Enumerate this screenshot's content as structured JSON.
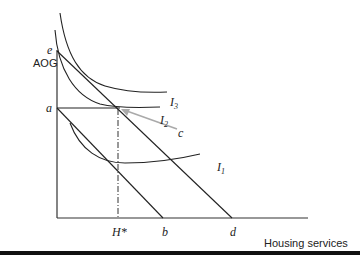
{
  "diagram": {
    "y_axis_label": "AOG",
    "x_axis_label": "Housing services",
    "points": {
      "e": "e",
      "a": "a",
      "b": "b",
      "d": "d",
      "c": "c",
      "h_star": "H*"
    },
    "indifference_curves": {
      "I1": {
        "base": "I",
        "sub": "1"
      },
      "I2": {
        "base": "I",
        "sub": "2"
      },
      "I3": {
        "base": "I",
        "sub": "3"
      }
    },
    "colors": {
      "lines": "#222222",
      "arrow": "#aaaaaa",
      "background": "#ffffff"
    }
  }
}
